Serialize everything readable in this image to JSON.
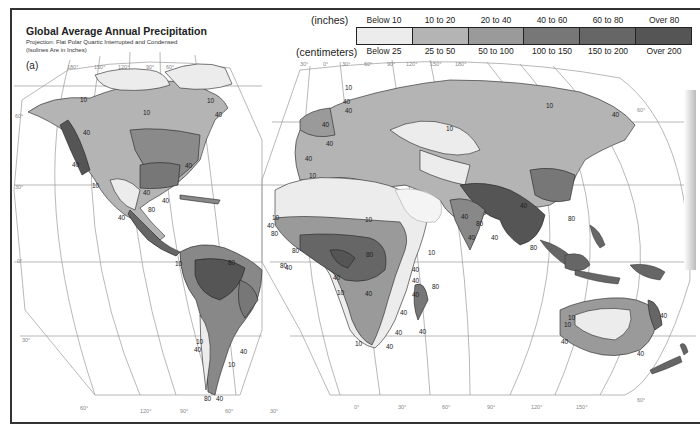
{
  "figure": {
    "title": "Global Average Annual Precipitation",
    "projection": "Projection: Flat Polar Quartic Interrupted and Condensed",
    "note": "(Isolines Are in Inches)",
    "panel": "(a)"
  },
  "legend": {
    "units_inches": "(inches)",
    "units_cm": "(centimeters)",
    "classes": [
      {
        "inches": "Below 10",
        "cm": "Below 25",
        "color": "#ececec"
      },
      {
        "inches": "10 to 20",
        "cm": "25 to 50",
        "color": "#b4b4b4"
      },
      {
        "inches": "20 to 40",
        "cm": "50 to 100",
        "color": "#9a9a9a"
      },
      {
        "inches": "40 to 60",
        "cm": "100 to 150",
        "color": "#777777"
      },
      {
        "inches": "60 to 80",
        "cm": "150 to 200",
        "color": "#666666"
      },
      {
        "inches": "Over 80",
        "cm": "Over 200",
        "color": "#555555"
      }
    ]
  },
  "graticule": {
    "west_top": [
      "180°",
      "150°",
      "120°",
      "90°",
      "60°",
      "30°"
    ],
    "west_bottom": [
      "120°",
      "90°",
      "60°",
      "30°"
    ],
    "east_top": [
      "30°",
      "0°",
      "30°",
      "60°",
      "90°",
      "120°",
      "150°",
      "180°"
    ],
    "east_bottom": [
      "0°",
      "30°",
      "60°",
      "90°",
      "120°",
      "150°"
    ],
    "lat_left": [
      "60°",
      "30°",
      "0°",
      "30°",
      "60°"
    ],
    "lat_right": [
      "60°",
      "60°"
    ]
  },
  "isolines": {
    "v10": "10",
    "v40": "40",
    "v80": "80"
  }
}
